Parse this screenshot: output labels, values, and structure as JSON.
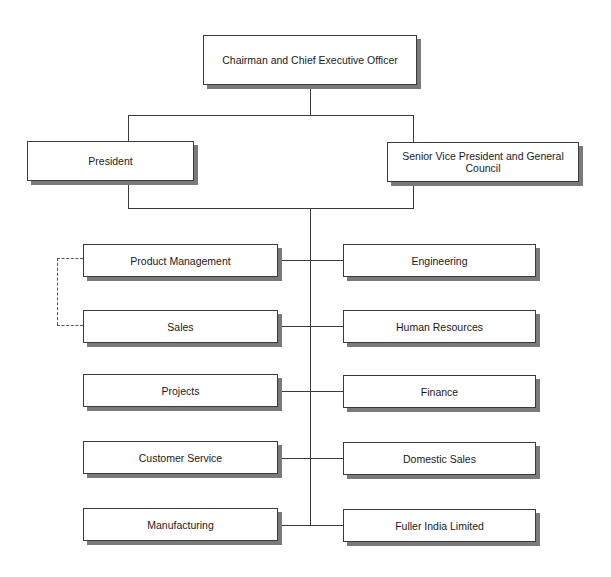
{
  "chart": {
    "type": "org-chart",
    "top": {
      "label": "Chairman and Chief Executive Officer"
    },
    "second_level": [
      {
        "label": "President"
      },
      {
        "label": "Senior Vice President and General Council"
      }
    ],
    "departments_left": [
      {
        "label": "Product Management"
      },
      {
        "label": "Sales"
      },
      {
        "label": "Projects"
      },
      {
        "label": "Customer Service"
      },
      {
        "label": "Manufacturing"
      }
    ],
    "departments_right": [
      {
        "label": "Engineering"
      },
      {
        "label": "Human Resources"
      },
      {
        "label": "Finance"
      },
      {
        "label": "Domestic Sales"
      },
      {
        "label": "Fuller India Limited"
      }
    ],
    "dotted_relationship": [
      "Product Management",
      "Sales"
    ],
    "colors": {
      "line": "#3a3a3a",
      "shadow": "#7a7a7a",
      "box_fill": "#ffffff",
      "text": "#1a1a1a"
    }
  }
}
